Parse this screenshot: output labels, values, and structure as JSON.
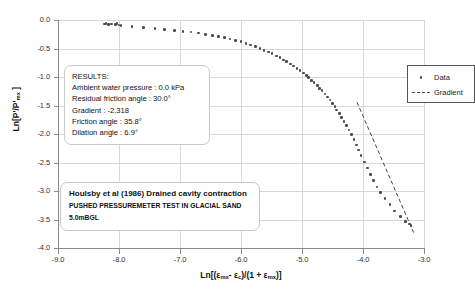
{
  "chart_data": {
    "type": "scatter",
    "title": "",
    "xlabel": "Ln[(εmx- εc)/(1 + εmx)]",
    "ylabel": "Ln[P'/P'mx ]",
    "xlim": [
      -9.0,
      -3.0
    ],
    "ylim": [
      -4.0,
      0.0
    ],
    "xticks": [
      "-9.0",
      "-8.0",
      "-7.0",
      "-6.0",
      "-5.0",
      "-4.0",
      "-3.0"
    ],
    "xtick_values": [
      -9.0,
      -8.0,
      -7.0,
      -6.0,
      -5.0,
      -4.0,
      -3.0
    ],
    "yticks": [
      "0.0",
      "-0.5",
      "-1.0",
      "-1.5",
      "-2.0",
      "-2.5",
      "-3.0",
      "-3.5",
      "-4.0"
    ],
    "ytick_values": [
      0.0,
      -0.5,
      -1.0,
      -1.5,
      -2.0,
      -2.5,
      -3.0,
      -3.5,
      -4.0
    ],
    "grid": true,
    "legend_position": "top-right",
    "series": [
      {
        "name": "Data",
        "type": "scatter",
        "marker": "dot",
        "color": "#4a4a4a",
        "points": [
          [
            -8.24,
            -0.07
          ],
          [
            -8.21,
            -0.06
          ],
          [
            -8.17,
            -0.08
          ],
          [
            -8.12,
            -0.07
          ],
          [
            -8.06,
            -0.08
          ],
          [
            -8.03,
            -0.06
          ],
          [
            -8.0,
            -0.09
          ],
          [
            -7.97,
            -0.1
          ],
          [
            -7.79,
            -0.11
          ],
          [
            -7.6,
            -0.13
          ],
          [
            -7.41,
            -0.15
          ],
          [
            -7.25,
            -0.17
          ],
          [
            -7.09,
            -0.18
          ],
          [
            -6.95,
            -0.2
          ],
          [
            -6.82,
            -0.21
          ],
          [
            -6.7,
            -0.23
          ],
          [
            -6.58,
            -0.25
          ],
          [
            -6.47,
            -0.27
          ],
          [
            -6.37,
            -0.29
          ],
          [
            -6.27,
            -0.31
          ],
          [
            -6.18,
            -0.33
          ],
          [
            -6.09,
            -0.36
          ],
          [
            -6.0,
            -0.38
          ],
          [
            -5.92,
            -0.41
          ],
          [
            -5.84,
            -0.44
          ],
          [
            -5.76,
            -0.47
          ],
          [
            -5.69,
            -0.5
          ],
          [
            -5.62,
            -0.53
          ],
          [
            -5.55,
            -0.56
          ],
          [
            -5.49,
            -0.59
          ],
          [
            -5.42,
            -0.63
          ],
          [
            -5.36,
            -0.66
          ],
          [
            -5.3,
            -0.7
          ],
          [
            -5.25,
            -0.73
          ],
          [
            -5.19,
            -0.77
          ],
          [
            -5.14,
            -0.81
          ],
          [
            -5.08,
            -0.85
          ],
          [
            -5.03,
            -0.89
          ],
          [
            -4.98,
            -0.93
          ],
          [
            -4.93,
            -0.97
          ],
          [
            -4.89,
            -1.01
          ],
          [
            -4.84,
            -1.06
          ],
          [
            -4.8,
            -1.1
          ],
          [
            -4.75,
            -1.15
          ],
          [
            -4.71,
            -1.2
          ],
          [
            -4.67,
            -1.24
          ],
          [
            -4.62,
            -1.3
          ],
          [
            -4.58,
            -1.35
          ],
          [
            -4.54,
            -1.4
          ],
          [
            -4.5,
            -1.46
          ],
          [
            -4.46,
            -1.52
          ],
          [
            -4.43,
            -1.58
          ],
          [
            -4.39,
            -1.64
          ],
          [
            -4.35,
            -1.71
          ],
          [
            -4.31,
            -1.78
          ],
          [
            -4.27,
            -1.85
          ],
          [
            -4.23,
            -1.93
          ],
          [
            -4.19,
            -2.01
          ],
          [
            -4.15,
            -2.1
          ],
          [
            -4.11,
            -2.19
          ],
          [
            -4.07,
            -2.28
          ],
          [
            -4.03,
            -2.38
          ],
          [
            -3.98,
            -2.49
          ],
          [
            -3.93,
            -2.6
          ],
          [
            -3.88,
            -2.71
          ],
          [
            -3.83,
            -2.82
          ],
          [
            -3.77,
            -2.93
          ],
          [
            -3.71,
            -3.03
          ],
          [
            -3.64,
            -3.13
          ],
          [
            -3.56,
            -3.24
          ],
          [
            -3.48,
            -3.35
          ],
          [
            -3.39,
            -3.45
          ],
          [
            -3.3,
            -3.53
          ],
          [
            -3.24,
            -3.58
          ],
          [
            -3.21,
            -3.61
          ]
        ]
      },
      {
        "name": "Gradient",
        "type": "line",
        "style": "dashed",
        "color": "#444444",
        "x0": -4.1,
        "y0": -1.44,
        "x1": -3.17,
        "y1": -3.73
      }
    ]
  },
  "legend": {
    "items": [
      {
        "label": "Data",
        "key": "marker-dot"
      },
      {
        "label": "Gradient",
        "key": "dashed-line"
      }
    ]
  },
  "results": {
    "heading": "RESULTS:",
    "lines": [
      "Ambient water pressure : 0.0 kPa",
      "Residual friction angle : 30.0°",
      "Gradient : -2.318",
      "Friction angle : 35.8°",
      "Dilation angle : 6.9°"
    ]
  },
  "note": {
    "title": "Houlsby et al (1986)    Drained cavity contraction",
    "subtitle": "PUSHED PRESSUREMETER TEST IN GLACIAL SAND",
    "depth": "5.0mBGL"
  },
  "colors": {
    "marker": "#4a4a4a",
    "gridline": "#d8d8d8",
    "axis": "#8a8a8a",
    "text": "#111111"
  }
}
